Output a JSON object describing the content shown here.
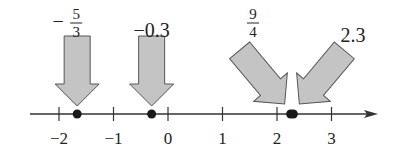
{
  "figure": {
    "type": "number-line",
    "axis": {
      "min": -2.5,
      "max": 3.8,
      "ticks": [
        -2,
        -1,
        0,
        1,
        2,
        3
      ],
      "tick_labels": [
        "−2",
        "−1",
        "0",
        "1",
        "2",
        "3"
      ]
    },
    "points": [
      {
        "label_type": "fraction",
        "sign": "−",
        "numerator": "5",
        "denominator": "3",
        "value": -1.6667,
        "arrow": "down"
      },
      {
        "label_type": "text",
        "text": "−0.3",
        "value": -0.3,
        "arrow": "down"
      },
      {
        "label_type": "fraction",
        "sign": "",
        "numerator": "9",
        "denominator": "4",
        "value": 2.25,
        "arrow": "down-right"
      },
      {
        "label_type": "text",
        "text": "2.3",
        "value": 2.3,
        "arrow": "down-left"
      }
    ],
    "colors": {
      "line": "#333333",
      "point": "#1a1a1a",
      "arrow_fill": "#c4c4c4",
      "arrow_stroke": "#555555"
    }
  }
}
